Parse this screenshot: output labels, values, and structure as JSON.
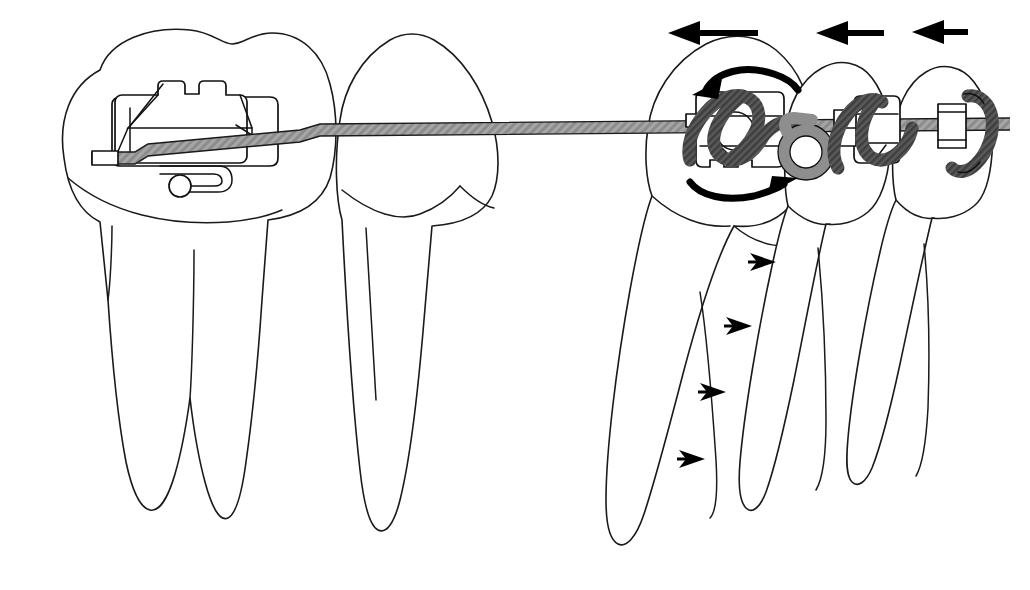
{
  "figure": {
    "background_color": "#ffffff",
    "line_color": "#1a1a1a",
    "wire_color": "#9a9a9a",
    "ligature_dark_color": "#4b4b4b",
    "ligature_light_color": "#8e8e8e",
    "arrow_color": "#000000",
    "canvas": {
      "width": 1030,
      "height": 590
    }
  },
  "teeth": [
    {
      "id": "tooth-1",
      "name": "first-molar",
      "position": "left",
      "roots": 2,
      "has_bracket": true,
      "bracket_type": "molar-tube-with-hook"
    },
    {
      "id": "tooth-2",
      "name": "second-premolar",
      "position": "left-center",
      "roots": 1,
      "has_bracket": false,
      "bracket_type": ""
    },
    {
      "id": "tooth-3",
      "name": "canine",
      "position": "right-center",
      "roots": 1,
      "has_bracket": true,
      "bracket_type": "twin-bracket-with-helical-loop"
    },
    {
      "id": "tooth-4",
      "name": "lateral-incisor",
      "position": "right",
      "roots": 1,
      "has_bracket": true,
      "bracket_type": "twin-bracket"
    },
    {
      "id": "tooth-5",
      "name": "central-incisor",
      "position": "far-right",
      "roots": 1,
      "has_bracket": true,
      "bracket_type": "twin-bracket"
    }
  ],
  "appliance": {
    "archwire_label": "archwire",
    "molar_tube_label": "molar tube",
    "hook_label": "bracket hook",
    "helical_loop_label": "helical loop",
    "ligature_label": "ligature tie"
  },
  "annotations": {
    "translation_arrows": [
      {
        "id": "arrow-translation-1",
        "direction": "left",
        "length": "long",
        "target": "canine"
      },
      {
        "id": "arrow-translation-2",
        "direction": "left",
        "length": "medium",
        "target": "lateral-incisor"
      },
      {
        "id": "arrow-translation-3",
        "direction": "left",
        "length": "short",
        "target": "central-incisor"
      }
    ],
    "rotation_arrows": [
      {
        "id": "arrow-rotation-upper",
        "direction": "counter-clockwise",
        "position": "above-canine-bracket"
      },
      {
        "id": "arrow-rotation-lower",
        "direction": "clockwise",
        "position": "below-canine-bracket"
      }
    ],
    "root_arrows": [
      {
        "id": "root-arrow-1",
        "direction": "right",
        "order": 1
      },
      {
        "id": "root-arrow-2",
        "direction": "right",
        "order": 2
      },
      {
        "id": "root-arrow-3",
        "direction": "right",
        "order": 3
      },
      {
        "id": "root-arrow-4",
        "direction": "right",
        "order": 4
      }
    ]
  }
}
